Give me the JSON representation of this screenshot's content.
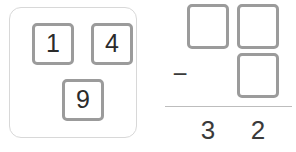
{
  "colors": {
    "tile_border": "#9b9b9b",
    "tray_border": "#d8d8d8",
    "digit": "#2b2b2b",
    "problem_text": "#3a3a3a",
    "rule": "#bdbdbd",
    "background": "#ffffff"
  },
  "tile_tray": {
    "label": "number-tile-tray",
    "tiles": [
      {
        "value": "1",
        "name": "tile-1"
      },
      {
        "value": "4",
        "name": "tile-4"
      },
      {
        "value": "9",
        "name": "tile-9"
      }
    ]
  },
  "problem": {
    "type": "subtraction",
    "minuend_slots": [
      {
        "place": "tens",
        "value": ""
      },
      {
        "place": "ones",
        "value": ""
      }
    ],
    "subtrahend_slots": [
      {
        "place": "ones",
        "value": ""
      }
    ],
    "operator": "−",
    "answer": {
      "tens": "3",
      "ones": "2"
    }
  }
}
